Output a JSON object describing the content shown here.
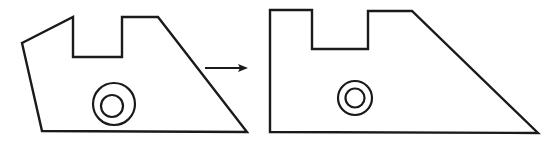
{
  "figure": {
    "background_color": "#ffffff",
    "line_color": "#1a1a1a",
    "canvas": {
      "width": 551,
      "height": 144
    }
  },
  "shapes": {
    "left_part": {
      "label": "tilted notched trapezoid plate",
      "stroke": "#1a1a1a",
      "fill": "#ffffff",
      "stroke_width": 2.4,
      "outline_points": "22,43 73,17 73,57 122,57 122,17 158,17 247,132 42,131",
      "holes": [
        {
          "label": "outer-circle",
          "cx": 114,
          "cy": 104,
          "r": 21
        },
        {
          "label": "inner-circle",
          "cx": 112,
          "cy": 106,
          "r": 11
        }
      ]
    },
    "right_part": {
      "label": "upright notched trapezoid plate",
      "stroke": "#1a1a1a",
      "fill": "#ffffff",
      "stroke_width": 2.4,
      "outline_points": "270,10 312,10 312,49 368,49 368,11 412,11 538,133 270,132",
      "holes": [
        {
          "label": "outer-circle",
          "cx": 355,
          "cy": 98,
          "r": 17
        },
        {
          "label": "inner-circle",
          "cx": 355,
          "cy": 98,
          "r": 9.5
        }
      ]
    }
  },
  "arrow": {
    "label": "transformation arrow",
    "direction": "right",
    "color": "#1a1a1a",
    "x1": 205,
    "x2": 241,
    "y": 68,
    "head_points": "248,68 238,64 240,68 238,72"
  }
}
